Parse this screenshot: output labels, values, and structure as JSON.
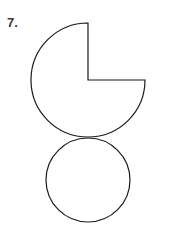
{
  "page": {
    "background_color": "#ffffff",
    "width": 173,
    "height": 246
  },
  "label": {
    "problem_number": "7.",
    "color": "#3a3a3a"
  },
  "figure": {
    "name": "snowman-composite-shape",
    "stroke_color": "#1a1a1a",
    "fill_color": "#ffffff",
    "stroke_width": 1.2,
    "shapes": [
      {
        "name": "three-quarter-circle",
        "type": "pac-man",
        "center_x": 88,
        "center_y": 80,
        "radius": 57,
        "missing_wedge_start_deg": 0,
        "missing_wedge_end_deg": 90,
        "missing_wedge_label": "upper-right quadrant removed",
        "notch_corner_x": 88,
        "notch_corner_y": 80,
        "notch_top_x": 88,
        "notch_top_y": 23,
        "notch_right_x": 145,
        "notch_right_y": 80
      },
      {
        "name": "lower-circle",
        "type": "circle",
        "center_x": 88,
        "center_y": 180,
        "radius": 42
      }
    ],
    "tangent_point_x": 88,
    "tangent_point_y": 137
  }
}
